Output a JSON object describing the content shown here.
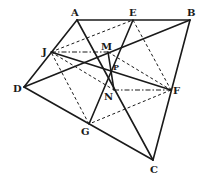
{
  "diagram": {
    "type": "geometry-figure",
    "points": {
      "A": {
        "label": "A",
        "x": 77,
        "y": 20
      },
      "E": {
        "label": "E",
        "x": 133,
        "y": 20
      },
      "B": {
        "label": "B",
        "x": 190,
        "y": 20
      },
      "J": {
        "label": "J",
        "x": 51,
        "y": 52
      },
      "M": {
        "label": "M",
        "x": 108,
        "y": 52
      },
      "P": {
        "label": "P",
        "x": 112,
        "y": 70
      },
      "D": {
        "label": "D",
        "x": 24,
        "y": 87
      },
      "N": {
        "label": "N",
        "x": 114,
        "y": 90
      },
      "F": {
        "label": "F",
        "x": 171,
        "y": 90
      },
      "G": {
        "label": "G",
        "x": 89,
        "y": 124
      },
      "C": {
        "label": "C",
        "x": 153,
        "y": 160
      }
    },
    "solid_segments": [
      "AB",
      "BC",
      "CD",
      "DA",
      "AC",
      "BD",
      "EG",
      "JF",
      "MN"
    ],
    "dashed_segments": [
      "JE",
      "EF",
      "FG",
      "GJ",
      "JN",
      "MF"
    ],
    "dashdot_segments": [
      "JM",
      "NF"
    ]
  }
}
